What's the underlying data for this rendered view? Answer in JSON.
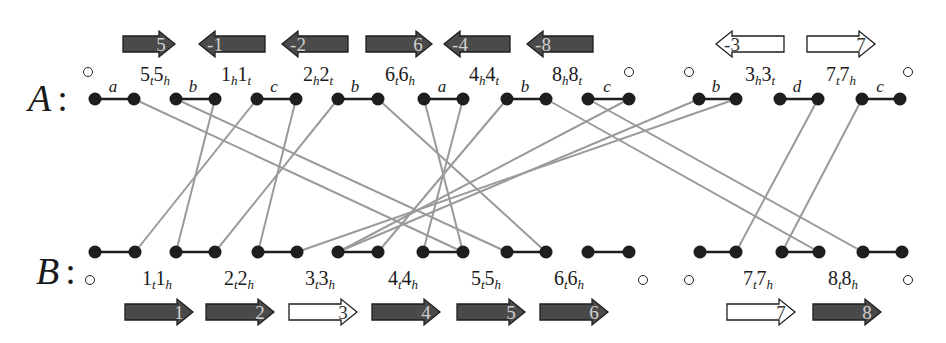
{
  "chart_data": {
    "type": "diagram",
    "title": "",
    "genomes": [
      {
        "name": "A",
        "row_label": "A",
        "colon": ":",
        "arrows": [
          {
            "label": "5",
            "direction": "right",
            "filled": true,
            "x": 123,
            "w": 52
          },
          {
            "label": "-1",
            "direction": "left",
            "filled": true,
            "x": 199,
            "w": 66
          },
          {
            "label": "-2",
            "direction": "left",
            "filled": true,
            "x": 282,
            "w": 66
          },
          {
            "label": "6",
            "direction": "right",
            "filled": true,
            "x": 366,
            "w": 66
          },
          {
            "label": "-4",
            "direction": "left",
            "filled": true,
            "x": 444,
            "w": 66
          },
          {
            "label": "-8",
            "direction": "left",
            "filled": true,
            "x": 527,
            "w": 66
          },
          {
            "label": "-3",
            "direction": "left",
            "filled": false,
            "x": 716,
            "w": 68
          },
          {
            "label": "7",
            "direction": "right",
            "filled": false,
            "x": 807,
            "w": 68
          }
        ],
        "gene_labels": [
          {
            "main": "5",
            "sub1": "t",
            "mid": "5",
            "sub2": "h",
            "x": 155
          },
          {
            "main": "1",
            "sub1": "h",
            "mid": "1",
            "sub2": "t",
            "x": 236
          },
          {
            "main": "2",
            "sub1": "h",
            "mid": "2",
            "sub2": "t",
            "x": 318
          },
          {
            "main": "6",
            "sub1": "t",
            "mid": "6",
            "sub2": "h",
            "x": 400
          },
          {
            "main": "4",
            "sub1": "h",
            "mid": "4",
            "sub2": "t",
            "x": 484
          },
          {
            "main": "8",
            "sub1": "h",
            "mid": "8",
            "sub2": "t",
            "x": 567
          },
          {
            "main": "3",
            "sub1": "h",
            "mid": "3",
            "sub2": "t",
            "x": 760
          },
          {
            "main": "7",
            "sub1": "t",
            "mid": "7",
            "sub2": "h",
            "x": 841
          }
        ],
        "adjacency_labels": [
          {
            "text": "a",
            "x": 113
          },
          {
            "text": "b",
            "x": 193
          },
          {
            "text": "c",
            "x": 274
          },
          {
            "text": "b",
            "x": 355
          },
          {
            "text": "a",
            "x": 442
          },
          {
            "text": "b",
            "x": 525
          },
          {
            "text": "c",
            "x": 607
          },
          {
            "text": "b",
            "x": 716
          },
          {
            "text": "d",
            "x": 797
          },
          {
            "text": "c",
            "x": 880
          }
        ],
        "telomeres_x": [
          88,
          629,
          689,
          908
        ],
        "nodes_x": [
          95,
          134,
          176,
          215,
          257,
          296,
          338,
          378,
          424,
          463,
          507,
          546,
          588,
          629,
          699,
          736,
          780,
          818,
          862,
          900
        ]
      },
      {
        "name": "B",
        "row_label": "B",
        "colon": ":",
        "arrows": [
          {
            "label": "1",
            "direction": "right",
            "filled": true,
            "x": 125,
            "w": 68
          },
          {
            "label": "2",
            "direction": "right",
            "filled": true,
            "x": 206,
            "w": 68
          },
          {
            "label": "3",
            "direction": "right",
            "filled": false,
            "x": 289,
            "w": 68
          },
          {
            "label": "4",
            "direction": "right",
            "filled": true,
            "x": 372,
            "w": 68
          },
          {
            "label": "5",
            "direction": "right",
            "filled": true,
            "x": 457,
            "w": 68
          },
          {
            "label": "6",
            "direction": "right",
            "filled": true,
            "x": 540,
            "w": 68
          },
          {
            "label": "7",
            "direction": "right",
            "filled": false,
            "x": 727,
            "w": 68
          },
          {
            "label": "8",
            "direction": "right",
            "filled": true,
            "x": 813,
            "w": 68
          }
        ],
        "gene_labels": [
          {
            "main": "1",
            "sub1": "t",
            "mid": "1",
            "sub2": "h",
            "x": 157
          },
          {
            "main": "2",
            "sub1": "t",
            "mid": "2",
            "sub2": "h",
            "x": 239
          },
          {
            "main": "3",
            "sub1": "t",
            "mid": "3",
            "sub2": "h",
            "x": 320
          },
          {
            "main": "4",
            "sub1": "t",
            "mid": "4",
            "sub2": "h",
            "x": 403
          },
          {
            "main": "5",
            "sub1": "t",
            "mid": "5",
            "sub2": "h",
            "x": 486
          },
          {
            "main": "6",
            "sub1": "t",
            "mid": "6",
            "sub2": "h",
            "x": 569
          },
          {
            "main": "7",
            "sub1": "t",
            "mid": "7",
            "sub2": "h",
            "x": 758
          },
          {
            "main": "8",
            "sub1": "t",
            "mid": "8",
            "sub2": "h",
            "x": 843
          }
        ],
        "telomeres_x": [
          90,
          643,
          689,
          908
        ],
        "nodes_x": [
          95,
          135,
          176,
          215,
          258,
          297,
          338,
          378,
          423,
          463,
          507,
          546,
          588,
          629,
          700,
          736,
          782,
          819,
          863,
          902
        ]
      }
    ],
    "edges": [
      [
        1,
        9
      ],
      [
        2,
        10
      ],
      [
        3,
        2
      ],
      [
        4,
        1
      ],
      [
        5,
        4
      ],
      [
        6,
        3
      ],
      [
        7,
        11
      ],
      [
        8,
        9
      ],
      [
        9,
        8
      ],
      [
        10,
        7
      ],
      [
        11,
        17
      ],
      [
        12,
        18
      ],
      [
        13,
        6
      ],
      [
        14,
        6
      ],
      [
        15,
        5
      ],
      [
        17,
        15
      ],
      [
        18,
        16
      ]
    ],
    "colors": {
      "ink": "#1a1a1a",
      "node": "#1e1e1e",
      "edge": "#9a9a9a",
      "arrow_fill": "#4a4a4a",
      "arrow_outline": "#1e1e1e",
      "arrow_text_filled": "#d0d0d0",
      "arrow_text_hollow": "#333333"
    }
  }
}
